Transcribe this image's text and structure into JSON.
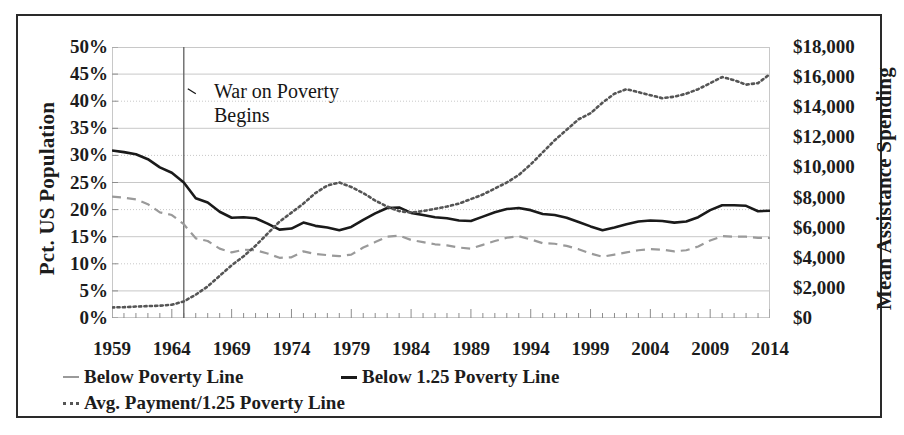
{
  "figure": {
    "annotation": {
      "line1": "War on Poverty",
      "line2": "Begins"
    },
    "colors": {
      "frame": "#2a2a2a",
      "text": "#1c1c1c",
      "below_poverty_line": "#9a9a9a",
      "below_125_poverty_line": "#1a1a1a",
      "avg_payment": "#555555",
      "gridline": "#c8c8c8",
      "event_line": "#6b6b6b"
    }
  },
  "chart_data": {
    "type": "line",
    "title": "",
    "xlabel": "",
    "ylabel": "Pct. US Population",
    "y2label": "Mean Assistance Spending",
    "xlim": [
      1959,
      2014
    ],
    "ylim": [
      0,
      50
    ],
    "y2lim": [
      0,
      18000
    ],
    "grid": true,
    "legend_position": "bottom-left",
    "xticks": [
      1959,
      1964,
      1969,
      1974,
      1979,
      1984,
      1989,
      1994,
      1999,
      2004,
      2009,
      2014
    ],
    "xticklabels": [
      "1959",
      "1964",
      "1969",
      "1974",
      "1979",
      "1984",
      "1989",
      "1994",
      "1999",
      "2004",
      "2009",
      "2014"
    ],
    "yticks": [
      0,
      5,
      10,
      15,
      20,
      25,
      30,
      35,
      40,
      45,
      50
    ],
    "yticklabels": [
      "0%",
      "5%",
      "10%",
      "15%",
      "20%",
      "25%",
      "30%",
      "35%",
      "40%",
      "45%",
      "50%"
    ],
    "y2ticks": [
      0,
      2000,
      4000,
      6000,
      8000,
      10000,
      12000,
      14000,
      16000,
      18000
    ],
    "y2ticklabels": [
      "$0",
      "$2,000",
      "$4,000",
      "$6,000",
      "$8,000",
      "$10,000",
      "$12,000",
      "$14,000",
      "$16,000",
      "$18,000"
    ],
    "annotations": [
      {
        "text": "War on Poverty Begins",
        "x": 1965,
        "type": "vertical-line-with-label"
      }
    ],
    "x": [
      1959,
      1960,
      1961,
      1962,
      1963,
      1964,
      1965,
      1966,
      1967,
      1968,
      1969,
      1970,
      1971,
      1972,
      1973,
      1974,
      1975,
      1976,
      1977,
      1978,
      1979,
      1980,
      1981,
      1982,
      1983,
      1984,
      1985,
      1986,
      1987,
      1988,
      1989,
      1990,
      1991,
      1992,
      1993,
      1994,
      1995,
      1996,
      1997,
      1998,
      1999,
      2000,
      2001,
      2002,
      2003,
      2004,
      2005,
      2006,
      2007,
      2008,
      2009,
      2010,
      2011,
      2012,
      2013,
      2014
    ],
    "series": [
      {
        "name": "Below Poverty Line",
        "axis": "left",
        "style": "dashed",
        "color": "#9a9a9a",
        "unit": "percent",
        "values": [
          22.4,
          22.2,
          21.9,
          21.0,
          19.5,
          19.0,
          17.3,
          14.7,
          14.2,
          12.8,
          12.1,
          12.6,
          12.5,
          11.9,
          11.1,
          11.2,
          12.3,
          11.8,
          11.6,
          11.4,
          11.7,
          13.0,
          14.0,
          15.0,
          15.2,
          14.4,
          14.0,
          13.6,
          13.4,
          13.0,
          12.8,
          13.5,
          14.2,
          14.8,
          15.1,
          14.5,
          13.8,
          13.7,
          13.3,
          12.7,
          11.9,
          11.3,
          11.7,
          12.1,
          12.5,
          12.7,
          12.6,
          12.3,
          12.5,
          13.2,
          14.3,
          15.1,
          15.0,
          15.0,
          14.8,
          14.8
        ]
      },
      {
        "name": "Below 1.25 Poverty Line",
        "axis": "left",
        "style": "solid",
        "color": "#1a1a1a",
        "unit": "percent",
        "values": [
          30.9,
          30.6,
          30.2,
          29.3,
          27.8,
          26.8,
          25.0,
          22.1,
          21.3,
          19.6,
          18.5,
          18.6,
          18.4,
          17.4,
          16.3,
          16.5,
          17.6,
          17.0,
          16.7,
          16.2,
          16.8,
          18.1,
          19.3,
          20.3,
          20.4,
          19.4,
          19.0,
          18.6,
          18.4,
          18.0,
          17.9,
          18.7,
          19.5,
          20.1,
          20.3,
          19.9,
          19.2,
          19.0,
          18.5,
          17.7,
          16.9,
          16.2,
          16.7,
          17.3,
          17.8,
          18.0,
          17.9,
          17.6,
          17.8,
          18.6,
          19.9,
          20.8,
          20.8,
          20.7,
          19.7,
          19.8
        ]
      },
      {
        "name": "Avg. Payment/1.25 Poverty Line",
        "axis": "right",
        "style": "dotted",
        "color": "#555555",
        "unit": "dollars",
        "values": [
          700,
          720,
          760,
          790,
          820,
          880,
          1100,
          1550,
          2100,
          2800,
          3500,
          4100,
          4800,
          5600,
          6400,
          7000,
          7600,
          8300,
          8800,
          9000,
          8700,
          8300,
          7800,
          7400,
          7100,
          7000,
          7100,
          7250,
          7400,
          7600,
          7900,
          8200,
          8600,
          9000,
          9500,
          10200,
          11000,
          11800,
          12500,
          13200,
          13600,
          14300,
          14900,
          15200,
          15000,
          14800,
          14600,
          14700,
          14900,
          15200,
          15600,
          16000,
          15800,
          15500,
          15600,
          16200
        ]
      }
    ]
  }
}
